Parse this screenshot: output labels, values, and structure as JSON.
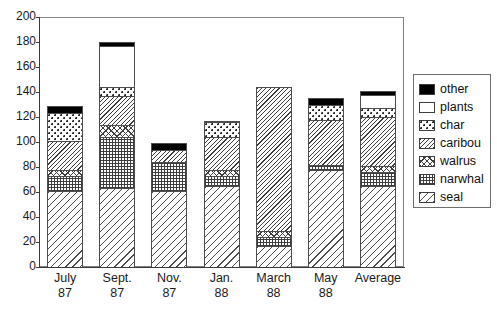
{
  "chart_data": {
    "type": "bar",
    "stacked": true,
    "title": "",
    "xlabel": "",
    "ylabel": "",
    "ylim": [
      0,
      200
    ],
    "yticks": [
      0,
      20,
      40,
      60,
      80,
      100,
      120,
      140,
      160,
      180,
      200
    ],
    "grid": false,
    "legend_position": "right",
    "categories": [
      "July 87",
      "Sept. 87",
      "Nov. 87",
      "Jan. 88",
      "March 88",
      "May 88",
      "Average"
    ],
    "category_lines": [
      {
        "line1": "July",
        "line2": "87"
      },
      {
        "line1": "Sept.",
        "line2": "87"
      },
      {
        "line1": "Nov.",
        "line2": "87"
      },
      {
        "line1": "Jan.",
        "line2": "88"
      },
      {
        "line1": "March",
        "line2": "88"
      },
      {
        "line1": "May",
        "line2": "88"
      },
      {
        "line1": "Average",
        "line2": ""
      }
    ],
    "series": [
      {
        "name": "seal",
        "pattern": "diagonal-sparse",
        "values": [
          61,
          63,
          61,
          65,
          17,
          78,
          65
        ]
      },
      {
        "name": "narwhal",
        "pattern": "grid",
        "values": [
          12,
          41,
          23,
          8,
          7,
          4,
          11
        ]
      },
      {
        "name": "walrus",
        "pattern": "crosshatch",
        "values": [
          5,
          10,
          0,
          5,
          5,
          0,
          5
        ]
      },
      {
        "name": "caribou",
        "pattern": "diagonal-dense",
        "values": [
          23,
          23,
          10,
          26,
          115,
          36,
          39
        ]
      },
      {
        "name": "char",
        "pattern": "dotted",
        "values": [
          22,
          7,
          0,
          12,
          0,
          12,
          7
        ]
      },
      {
        "name": "plants",
        "pattern": "white",
        "values": [
          0,
          33,
          0,
          0,
          0,
          0,
          11
        ]
      },
      {
        "name": "other",
        "pattern": "black",
        "values": [
          6,
          3,
          5,
          1,
          0,
          5,
          3
        ]
      }
    ],
    "totals": [
      129,
      180,
      99,
      117,
      144,
      135,
      141
    ],
    "legend": [
      {
        "label": "other",
        "pattern": "black"
      },
      {
        "label": "plants",
        "pattern": "white"
      },
      {
        "label": "char",
        "pattern": "dotted"
      },
      {
        "label": "caribou",
        "pattern": "diagonal-dense"
      },
      {
        "label": "walrus",
        "pattern": "crosshatch"
      },
      {
        "label": "narwhal",
        "pattern": "grid"
      },
      {
        "label": "seal",
        "pattern": "diagonal-sparse"
      }
    ]
  }
}
